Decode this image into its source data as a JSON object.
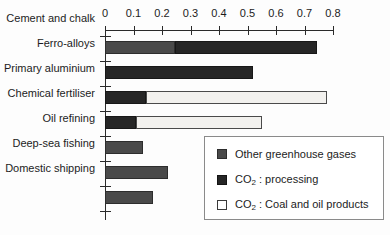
{
  "chart_data": {
    "type": "bar",
    "orientation": "horizontal",
    "stacked": true,
    "title": "",
    "xlabel": "",
    "ylabel": "",
    "xlim": [
      0,
      0.8
    ],
    "xticks": [
      0,
      0.1,
      0.2,
      0.3,
      0.4,
      0.5,
      0.6,
      0.7,
      0.8
    ],
    "xtick_labels": [
      "0",
      "0.1",
      "0.2",
      "0.3",
      "0.4",
      "0.5",
      "0.6",
      "0.7",
      "0.8"
    ],
    "grid": false,
    "legend_position": "lower right",
    "categories": [
      "Cement and chalk",
      "Ferro-alloys",
      "Primary aluminium",
      "Chemical fertiliser",
      "Oil refining",
      "Deep-sea fishing",
      "Domestic shipping"
    ],
    "series": [
      {
        "name": "Other greenhouse gases",
        "key": "other",
        "color": "#4a4a4a",
        "values": [
          0.245,
          0.0,
          0.0,
          0.0,
          0.135,
          0.22,
          0.17
        ]
      },
      {
        "name": "CO2 : processing",
        "key": "processing",
        "color": "#262626",
        "values": [
          0.5,
          0.52,
          0.145,
          0.11,
          0.0,
          0.0,
          0.0
        ]
      },
      {
        "name": "CO2 : Coal and oil products",
        "key": "coal",
        "color": "#f2f1ee",
        "values": [
          0.0,
          0.0,
          0.635,
          0.44,
          0.0,
          0.0,
          0.0
        ]
      }
    ],
    "totals": [
      0.745,
      0.52,
      0.78,
      0.55,
      0.135,
      0.22,
      0.17
    ]
  },
  "legend": {
    "items": [
      {
        "label": "Other greenhouse gases",
        "swatch": "other"
      },
      {
        "label_prefix": "CO",
        "label_sub": "2",
        "label_suffix": " : processing",
        "swatch": "processing"
      },
      {
        "label_prefix": "CO",
        "label_sub": "2",
        "label_suffix": " : Coal and oil products",
        "swatch": "coal"
      }
    ],
    "item0_label": "Other greenhouse gases",
    "item1_prefix": "CO",
    "item1_sub": "2",
    "item1_suffix": " : processing",
    "item2_prefix": "CO",
    "item2_sub": "2",
    "item2_suffix": " : Coal and oil products"
  },
  "axis": {
    "tick0": "0",
    "tick1": "0.1",
    "tick2": "0.2",
    "tick3": "0.3",
    "tick4": "0.4",
    "tick5": "0.5",
    "tick6": "0.6",
    "tick7": "0.7",
    "tick8": "0.8"
  },
  "categories": {
    "cat0": "Cement and chalk",
    "cat1": "Ferro-alloys",
    "cat2": "Primary aluminium",
    "cat3": "Chemical fertiliser",
    "cat4": "Oil refining",
    "cat5": "Deep-sea fishing",
    "cat6": "Domestic shipping"
  }
}
